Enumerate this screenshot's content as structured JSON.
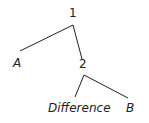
{
  "tree": {
    "root": {
      "label": "1"
    },
    "left_leaf": {
      "label": "A"
    },
    "inner_node": {
      "label": "2"
    },
    "inner_left_leaf": {
      "label": "Difference"
    },
    "inner_right_leaf": {
      "label": "B"
    }
  },
  "colors": {
    "line": "#222222",
    "text": "#222222"
  }
}
